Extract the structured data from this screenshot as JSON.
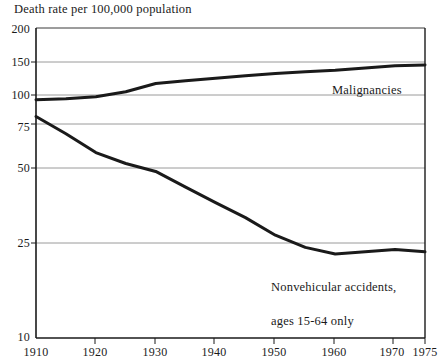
{
  "chart_data": {
    "type": "line",
    "title": "Death rate per 100,000 population",
    "xlabel": "",
    "ylabel": "Death rate per 100,000 population",
    "yscale": "log",
    "ylim": [
      10,
      200
    ],
    "xlim": [
      1910,
      1975
    ],
    "grid": true,
    "legend_position": "inline-annotation",
    "y_ticks": [
      200,
      150,
      100,
      75,
      50,
      25,
      10
    ],
    "y_tick_labels": [
      "200",
      "150",
      "100",
      "75",
      "50",
      "25",
      "10"
    ],
    "x_ticks": [
      1910,
      1920,
      1930,
      1940,
      1950,
      1960,
      1970,
      1975
    ],
    "x_tick_labels": [
      "1910",
      "1920",
      "1930",
      "1940",
      "1950",
      "1960",
      "1970",
      "1975"
    ],
    "series": [
      {
        "name": "Malignancies",
        "annotation": "Malignancies",
        "x": [
          1910,
          1915,
          1920,
          1925,
          1930,
          1935,
          1940,
          1945,
          1950,
          1955,
          1960,
          1965,
          1970,
          1975
        ],
        "values": [
          100,
          101,
          103,
          108,
          117,
          120,
          123,
          126,
          129,
          131,
          133,
          136,
          139,
          140
        ]
      },
      {
        "name": "Nonvehicular accidents, ages 15-64 only",
        "annotation": "Nonvehicular accidents,\nages 15-64 only",
        "x": [
          1910,
          1915,
          1920,
          1925,
          1930,
          1935,
          1940,
          1945,
          1950,
          1955,
          1960,
          1965,
          1970,
          1975
        ],
        "values": [
          85,
          72,
          60,
          54,
          50,
          43,
          37,
          32,
          27,
          24,
          22.5,
          23,
          23.5,
          23
        ]
      }
    ]
  },
  "chart": {
    "title": "Death rate per 100,000 population",
    "annotations": {
      "malignancies": "Malignancies",
      "nonvehicular_line1": "Nonvehicular accidents,",
      "nonvehicular_line2": "ages 15-64 only"
    },
    "y_labels": {
      "t0": "200",
      "t1": "150",
      "t2": "100",
      "t3": "75",
      "t4": "50",
      "t5": "25",
      "t6": "10"
    },
    "x_labels": {
      "t0": "1910",
      "t1": "1920",
      "t2": "1930",
      "t3": "1940",
      "t4": "1950",
      "t5": "1960",
      "t6": "1970",
      "t7": "1975"
    },
    "colors": {
      "line": "#1a1a1a",
      "gridline": "#9a9a9a",
      "axis": "#1a1a1a",
      "background": "#ffffff"
    }
  }
}
